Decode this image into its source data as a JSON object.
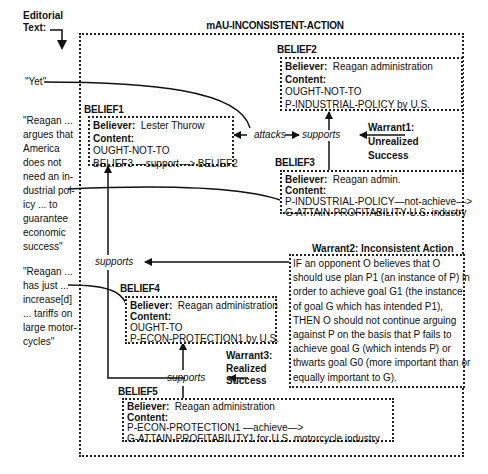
{
  "editorial": {
    "label_line1": "Editorial",
    "label_line2": "Text:",
    "quotes": [
      {
        "id": "yet",
        "lines": [
          "\"Yet\""
        ]
      },
      {
        "id": "reagan-argues",
        "lines": [
          "\"Reagan ...",
          "argues that",
          "America",
          "does not",
          "need an in-",
          "dustrial pol-",
          "icy ... to",
          "guarantee",
          "economic",
          "success\""
        ]
      },
      {
        "id": "reagan-tariffs",
        "lines": [
          "\"Reagan ...",
          "has just ...",
          "increase[d]",
          "... tariffs on",
          "large motor-",
          "cycles\""
        ]
      }
    ]
  },
  "diagram": {
    "title": "mAU-INCONSISTENT-ACTION",
    "beliefs": [
      {
        "id": "BELIEF1",
        "label": "BELIEF1",
        "believer_key": "Believer:",
        "believer": "Lester Thurow",
        "content_key": "Content:",
        "content": [
          "OUGHT-NOT-TO",
          "BELIEF3 —support—> BELIEF2"
        ]
      },
      {
        "id": "BELIEF2",
        "label": "BELIEF2",
        "believer_key": "Believer:",
        "believer": "Reagan administration",
        "content_key": "Content:",
        "content": [
          "OUGHT-NOT-TO",
          "P-INDUSTRIAL-POLICY by U.S."
        ]
      },
      {
        "id": "BELIEF3",
        "label": "BELIEF3",
        "believer_key": "Believer:",
        "believer": "Reagan admin.",
        "content_key": "Content:",
        "content": [
          "P-INDUSTRIAL-POLICY—not-achieve—>",
          "G-ATTAIN-PROFITABILITY U.S. industry"
        ]
      },
      {
        "id": "BELIEF4",
        "label": "BELIEF4",
        "believer_key": "Believer:",
        "believer": "Reagan administration",
        "content_key": "Content:",
        "content": [
          "OUGHT-TO",
          "P-ECON-PROTECTION1 by U.S."
        ]
      },
      {
        "id": "BELIEF5",
        "label": "BELIEF5",
        "believer_key": "Believer:",
        "believer": "Reagan administration",
        "content_key": "Content:",
        "content": [
          "P-ECON-PROTECTION1 —achieve—>",
          "G-ATTAIN-PROFITABILITY1 for U.S. motorcycle industry"
        ]
      }
    ],
    "relations": {
      "attacks": "attacks",
      "supports_top": "supports",
      "supports_mid": "supports",
      "supports_bottom": "supports"
    },
    "warrants": {
      "warrant1": [
        "Warrant1:",
        "Unrealized",
        "Success"
      ],
      "warrant2_title": "Warrant2: Inconsistent Action",
      "warrant2_text": [
        "IF an opponent O believes that O",
        "should use plan P1 (an instance of P) in",
        "order to achieve goal G1 (the instance",
        "of goal G which has intended P1),",
        "THEN O should not continue arguing",
        "against P on the basis that P fails to",
        "achieve goal  G (which intends P) or",
        "thwarts goal G0 (more important than or",
        "equally important to G)."
      ],
      "warrant3": [
        "Warrant3:",
        "Realized",
        "Success"
      ]
    }
  }
}
